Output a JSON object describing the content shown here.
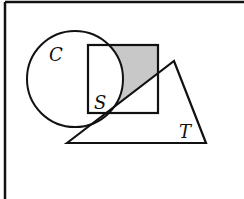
{
  "diagram": {
    "type": "venn-like-set-diagram",
    "frame": {
      "left_border": true,
      "top_border": true,
      "right_border": false,
      "bottom_border": false,
      "stroke": "#111111"
    },
    "shapes": [
      {
        "id": "C",
        "kind": "circle",
        "label": "C",
        "cx": 75,
        "cy": 79,
        "r": 48
      },
      {
        "id": "S",
        "kind": "square",
        "label": "S",
        "x": 88,
        "y": 45,
        "width": 70,
        "height": 68
      },
      {
        "id": "T",
        "kind": "triangle",
        "label": "T",
        "points": [
          [
            67,
            143
          ],
          [
            174,
            61
          ],
          [
            206,
            143
          ]
        ]
      }
    ],
    "labels": {
      "circle": "C",
      "square": "S",
      "triangle": "T"
    },
    "shaded_region": {
      "description": "Part of square S outside circle C and above the triangle T's left edge",
      "fill": "#c8c8c8"
    },
    "colors": {
      "stroke": "#111111",
      "shade": "#c8c8c8",
      "background": "#ffffff"
    }
  }
}
